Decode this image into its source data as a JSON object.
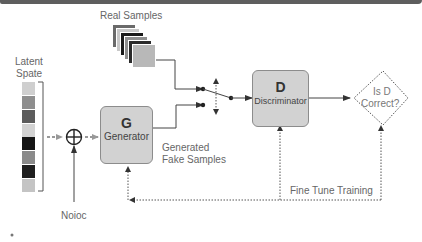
{
  "labels": {
    "real_samples": "Real Samples",
    "latent_space_line1": "Latent",
    "latent_space_line2": "Spate",
    "noise": "Noioc",
    "generated_line1": "Generated",
    "generated_line2": "Fake Samples",
    "fine_tune": "Fine Tune Training"
  },
  "generator": {
    "letter": "G",
    "name": "Generator"
  },
  "discriminator": {
    "letter": "D",
    "name": "Discriminator"
  },
  "decision": {
    "line1": "Is D",
    "line2": "Correct?"
  },
  "latent_cells": [
    "#cfcfcf",
    "#8e8e8e",
    "#5c5c5c",
    "#d2d2d2",
    "#151515",
    "#8a8a8a",
    "#1e1e1e",
    "#c4c4c4"
  ],
  "real_sample_stack": [
    "#6a6a6a",
    "#c8c8c8",
    "#1a1a1a",
    "#8f8f8f",
    "#2a2a2a",
    "#b8b8b8"
  ],
  "colors": {
    "box_fill": "#d2d2d2",
    "line": "#444444",
    "dotted": "#666666",
    "topbar": "#5e5e5e"
  }
}
